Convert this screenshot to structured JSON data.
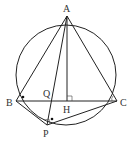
{
  "diagram": {
    "circle": {
      "cx": 66,
      "cy": 75,
      "r": 50
    },
    "points": {
      "A": {
        "x": 67,
        "y": 16,
        "label": "A"
      },
      "B": {
        "x": 16,
        "y": 101,
        "label": "B"
      },
      "C": {
        "x": 117,
        "y": 101,
        "label": "C"
      },
      "H": {
        "x": 67,
        "y": 101,
        "label": "H"
      },
      "Q": {
        "x": 51,
        "y": 101,
        "label": "Q"
      },
      "P": {
        "x": 47,
        "y": 125,
        "label": "P"
      }
    },
    "segments": [
      "AB",
      "AC",
      "BC",
      "AH",
      "AP",
      "BP",
      "PC"
    ],
    "right_angles": [
      "AHC",
      "APC"
    ],
    "equal_angle_marks": [
      "ABC",
      "BPC"
    ]
  }
}
